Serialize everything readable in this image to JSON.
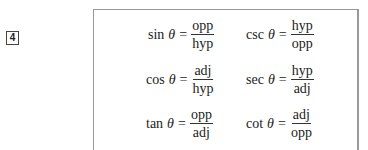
{
  "item_number": "4",
  "formulas": [
    {
      "fn": "sin",
      "var": "θ",
      "eq": "=",
      "num": "opp",
      "den": "hyp"
    },
    {
      "fn": "csc",
      "var": "θ",
      "eq": "=",
      "num": "hyp",
      "den": "opp"
    },
    {
      "fn": "cos",
      "var": "θ",
      "eq": "=",
      "num": "adj",
      "den": "hyp"
    },
    {
      "fn": "sec",
      "var": "θ",
      "eq": "=",
      "num": "hyp",
      "den": "adj"
    },
    {
      "fn": "tan",
      "var": "θ",
      "eq": "=",
      "num": "opp",
      "den": "adj"
    },
    {
      "fn": "cot",
      "var": "θ",
      "eq": "=",
      "num": "adj",
      "den": "opp"
    }
  ]
}
